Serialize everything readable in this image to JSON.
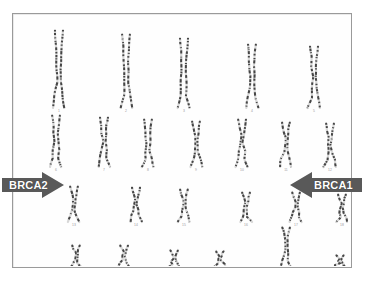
{
  "image": {
    "type": "karyotype-photograph",
    "description": "G-banded human karyotype, 22 autosome pairs plus X and Y, with two annotation arrows",
    "background_color": "#fefefe",
    "frame_color": "#9a9a9a"
  },
  "annotations": [
    {
      "id": "brca2",
      "label": "BRCA2",
      "direction": "right",
      "points_to": "13",
      "fill_color": "#595959",
      "text_color": "#ffffff"
    },
    {
      "id": "brca1",
      "label": "BRCA1",
      "direction": "left",
      "points_to": "17",
      "fill_color": "#595959",
      "text_color": "#ffffff"
    }
  ],
  "karyotype": {
    "rows": [
      {
        "row_index": 1,
        "pairs": [
          {
            "label": "1",
            "x": 45,
            "height": 78
          },
          {
            "label": "2",
            "x": 112,
            "height": 74
          },
          {
            "label": "3",
            "x": 170,
            "height": 70
          },
          {
            "label": "4",
            "x": 238,
            "height": 64
          },
          {
            "label": "5",
            "x": 300,
            "height": 62
          }
        ]
      },
      {
        "row_index": 2,
        "pairs": [
          {
            "label": "6",
            "x": 42,
            "height": 52
          },
          {
            "label": "7",
            "x": 90,
            "height": 50
          },
          {
            "label": "8",
            "x": 134,
            "height": 48
          },
          {
            "label": "9",
            "x": 182,
            "height": 46
          },
          {
            "label": "10",
            "x": 228,
            "height": 48
          },
          {
            "label": "11",
            "x": 272,
            "height": 45
          },
          {
            "label": "12",
            "x": 316,
            "height": 44
          }
        ]
      },
      {
        "row_index": 3,
        "pairs": [
          {
            "label": "13",
            "x": 60,
            "height": 36
          },
          {
            "label": "14",
            "x": 122,
            "height": 35
          },
          {
            "label": "15",
            "x": 170,
            "height": 33
          },
          {
            "label": "16",
            "x": 232,
            "height": 30
          },
          {
            "label": "17",
            "x": 282,
            "height": 30
          },
          {
            "label": "18",
            "x": 328,
            "height": 28
          }
        ]
      },
      {
        "row_index": 4,
        "pairs": [
          {
            "label": "19",
            "x": 62,
            "height": 22
          },
          {
            "label": "20",
            "x": 110,
            "height": 22
          },
          {
            "label": "21",
            "x": 160,
            "height": 17
          },
          {
            "label": "22",
            "x": 206,
            "height": 16
          },
          {
            "label": "X",
            "x": 272,
            "height": 40
          },
          {
            "label": "Y",
            "x": 326,
            "height": 12
          }
        ]
      }
    ]
  }
}
